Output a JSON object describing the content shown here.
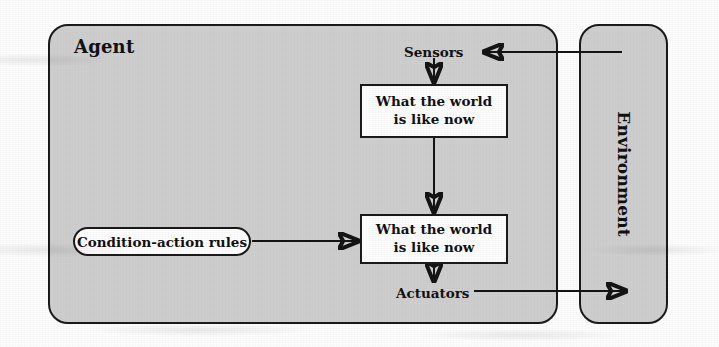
{
  "diagram": {
    "title_agent": "Agent",
    "title_environment": "Environment",
    "boxes": [
      {
        "id": "world-1",
        "label": "What the world is like now"
      },
      {
        "id": "world-2",
        "label": "What the world is like now"
      }
    ],
    "pill": {
      "id": "condition-action-rules",
      "label": "Condition-action rules"
    },
    "labels": {
      "sensors": "Sensors",
      "actuators": "Actuators"
    },
    "colors": {
      "shell_fill": "#cecece",
      "shell_stroke": "#1a1a1a",
      "box_fill": "#fdfdfd",
      "page_background": "#fdfdfd",
      "ink": "#111111"
    },
    "edges": [
      {
        "id": "environment-to-sensors",
        "from": "Environment",
        "to": "Sensors",
        "direction": "left"
      },
      {
        "id": "sensors-to-world-1",
        "from": "Sensors",
        "to": "What the world is like now",
        "direction": "down"
      },
      {
        "id": "world-1-to-world-2",
        "from": "What the world is like now",
        "to": "What the world is like now",
        "direction": "down"
      },
      {
        "id": "rules-to-world-2",
        "from": "Condition-action rules",
        "to": "What the world is like now",
        "direction": "right"
      },
      {
        "id": "world-2-to-actuators",
        "from": "What the world is like now",
        "to": "Actuators",
        "direction": "down"
      },
      {
        "id": "actuators-to-environment",
        "from": "Actuators",
        "to": "Environment",
        "direction": "right"
      }
    ]
  }
}
